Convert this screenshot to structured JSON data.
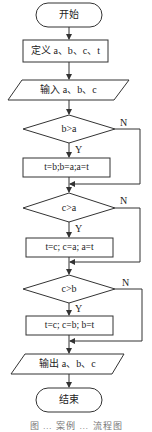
{
  "flowchart": {
    "start": {
      "label": "开始"
    },
    "define": {
      "label": "定义 a、b、c、t"
    },
    "input": {
      "label": "输入 a、b、c"
    },
    "decision1": {
      "label": "b>a",
      "yes": "Y",
      "no": "N"
    },
    "process1": {
      "label": "t=b;b=a;a=t"
    },
    "decision2": {
      "label": "c>a",
      "yes": "Y",
      "no": "N"
    },
    "process2": {
      "label": "t=c; c=a; a=t"
    },
    "decision3": {
      "label": "c>b",
      "yes": "Y",
      "no": "N"
    },
    "process3": {
      "label": "t=c; c=b; b=t"
    },
    "output": {
      "label": "输出 a、b、c"
    },
    "end": {
      "label": "结束"
    }
  },
  "caption": "图 … 案例 … 流程图",
  "colors": {
    "stroke": "#333333",
    "background": "#ffffff",
    "text": "#222222"
  }
}
